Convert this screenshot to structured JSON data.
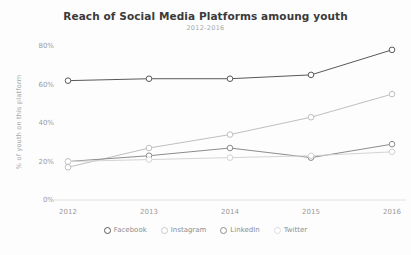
{
  "chart_data": {
    "type": "line",
    "title": "Reach of Social Media Platforms amoung youth",
    "subtitle": "2012-2016",
    "xlabel": "",
    "ylabel": "% of youth on this platform",
    "categories": [
      "2012",
      "2013",
      "2014",
      "2015",
      "2016"
    ],
    "x_ticks": [
      "2012",
      "2013",
      "2014",
      "2015",
      "2016"
    ],
    "y_ticks": [
      "0%",
      "20%",
      "40%",
      "60%",
      "80%"
    ],
    "ylim": [
      0,
      80
    ],
    "grid": false,
    "legend_position": "bottom",
    "series": [
      {
        "name": "Facebook",
        "color": "#595959",
        "marker": "circle-open",
        "values": [
          62,
          63,
          63,
          65,
          78
        ]
      },
      {
        "name": "Instagram",
        "color": "#bfbfbf",
        "marker": "circle-open",
        "values": [
          17,
          27,
          34,
          43,
          55
        ]
      },
      {
        "name": "LinkedIn",
        "color": "#8c8c8c",
        "marker": "circle-open",
        "values": [
          20,
          23,
          27,
          22,
          29
        ]
      },
      {
        "name": "Twitter",
        "color": "#d4d4d4",
        "marker": "circle-open",
        "values": [
          20,
          21,
          22,
          23,
          25
        ]
      }
    ]
  },
  "legend": {
    "items": [
      {
        "label": "Facebook",
        "color": "#595959"
      },
      {
        "label": "Instagram",
        "color": "#c9c9c9"
      },
      {
        "label": "LinkedIn",
        "color": "#8c8c8c"
      },
      {
        "label": "Twitter",
        "color": "#dcdcdc"
      }
    ]
  },
  "axes": {
    "y_title": "% of youth on this platform"
  }
}
